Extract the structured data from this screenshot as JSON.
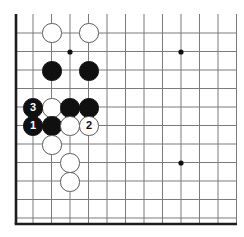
{
  "figure": {
    "kind": "go-board-diagram",
    "board_size": 19,
    "view": "lower-left corner, cropped at top and right"
  },
  "geometry": {
    "cell": 18.5,
    "origin_x": 33,
    "origin_y": 33,
    "cols": 12,
    "rows": 11,
    "stone_radius": 9.6,
    "edge_left_x": 16,
    "edge_bottom_y": 224,
    "grid_top_y": 14,
    "grid_right_x": 237
  },
  "colors": {
    "background": "#ffffff",
    "grid_line": "#7b7b7b",
    "board_edge": "#1c1c1c",
    "black_stone": "#101010",
    "white_stone": "#ffffff",
    "white_stone_border": "#5a5a5a",
    "star_point": "#101010",
    "black_label_text": "#ffffff",
    "white_label_text": "#101010"
  },
  "star_points": [
    {
      "name": "star-point-upper-left",
      "x": 70,
      "y": 52
    },
    {
      "name": "star-point-upper-right",
      "x": 181,
      "y": 52
    },
    {
      "name": "star-point-lower-right",
      "x": 181,
      "y": 163
    }
  ],
  "stones": [
    {
      "id": "white-a",
      "color": "white",
      "x": 52,
      "y": 33,
      "label": ""
    },
    {
      "id": "white-b",
      "color": "white",
      "x": 89,
      "y": 33,
      "label": ""
    },
    {
      "id": "black-a",
      "color": "black",
      "x": 52,
      "y": 71,
      "label": ""
    },
    {
      "id": "black-b",
      "color": "black",
      "x": 89,
      "y": 71,
      "label": ""
    },
    {
      "id": "black-move-3",
      "color": "black",
      "x": 33,
      "y": 108,
      "label": "3"
    },
    {
      "id": "white-c",
      "color": "white",
      "x": 52,
      "y": 108,
      "label": ""
    },
    {
      "id": "black-c",
      "color": "black",
      "x": 70,
      "y": 108,
      "label": ""
    },
    {
      "id": "black-d",
      "color": "black",
      "x": 89,
      "y": 108,
      "label": ""
    },
    {
      "id": "black-move-1",
      "color": "black",
      "x": 33,
      "y": 126,
      "label": "1"
    },
    {
      "id": "black-e",
      "color": "black",
      "x": 52,
      "y": 126,
      "label": ""
    },
    {
      "id": "white-d",
      "color": "white",
      "x": 70,
      "y": 126,
      "label": ""
    },
    {
      "id": "white-move-2",
      "color": "white",
      "x": 89,
      "y": 126,
      "label": "2"
    },
    {
      "id": "white-e",
      "color": "white",
      "x": 52,
      "y": 145,
      "label": ""
    },
    {
      "id": "white-f",
      "color": "white",
      "x": 70,
      "y": 163,
      "label": ""
    },
    {
      "id": "white-g",
      "color": "white",
      "x": 70,
      "y": 182,
      "label": ""
    }
  ],
  "move_sequence": [
    {
      "number": "1",
      "color": "black"
    },
    {
      "number": "2",
      "color": "white"
    },
    {
      "number": "3",
      "color": "black"
    }
  ]
}
